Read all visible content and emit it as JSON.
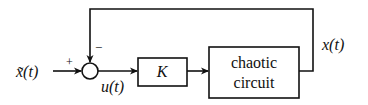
{
  "diagram": {
    "input_label": "x̃(t)",
    "input_sign": "+",
    "feedback_sign": "−",
    "control_label": "u(t)",
    "gain_block": "K",
    "plant_block_line1": "chaotic",
    "plant_block_line2": "circuit",
    "output_label": "x(t)"
  },
  "colors": {
    "stroke": "#111111",
    "background": "#ffffff"
  }
}
